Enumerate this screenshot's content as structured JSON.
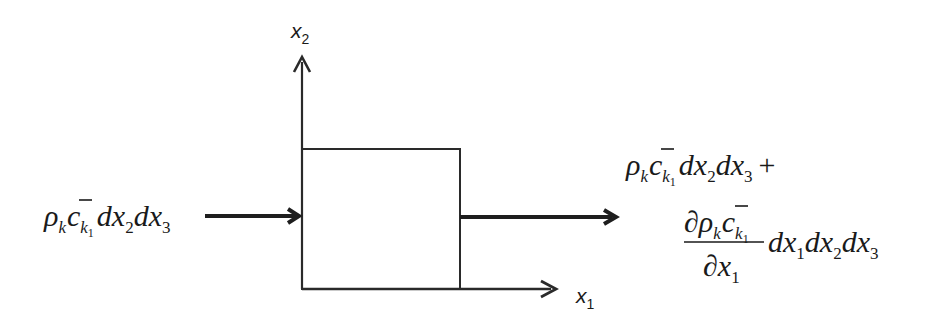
{
  "diagram": {
    "title": "",
    "axes": {
      "x1": {
        "label": "x",
        "subscript": "1"
      },
      "x2": {
        "label": "x",
        "subscript": "2"
      }
    },
    "control_volume": {
      "shape": "rectangle",
      "label": ""
    },
    "inflow": {
      "text": "ρkc̄k1dx2dx3",
      "parts": {
        "rho": "ρ",
        "rho_sub": "k",
        "c": "c",
        "c_sub": "k",
        "c_sub_sub": "1",
        "d1": "d",
        "x1": "x",
        "x1_sub": "2",
        "d2": "d",
        "x2": "x",
        "x2_sub": "3"
      }
    },
    "outflow": {
      "line1": {
        "text": "ρkc̄k1dx2dx3 +",
        "rho": "ρ",
        "rho_sub": "k",
        "c": "c",
        "c_sub": "k",
        "c_sub_sub": "1",
        "d1": "d",
        "x1": "x",
        "x1_sub": "2",
        "d2": "d",
        "x2": "x",
        "x2_sub": "3",
        "plus": "+"
      },
      "line2": {
        "text": "∂ρkc̄k1/∂x1 dx1dx2dx3",
        "num_partial": "∂",
        "num_rho": "ρ",
        "num_rho_sub": "k",
        "num_c": "c",
        "num_c_sub": "k",
        "num_c_sub_sub": "1",
        "den_partial": "∂",
        "den_x": "x",
        "den_x_sub": "1",
        "d1": "d",
        "x1": "x",
        "x1_sub": "1",
        "d2": "d",
        "x2": "x",
        "x2_sub": "2",
        "d3": "d",
        "x3": "x",
        "x3_sub": "3"
      }
    },
    "colors": {
      "stroke": "#1e1e1e",
      "background": "#ffffff"
    }
  }
}
